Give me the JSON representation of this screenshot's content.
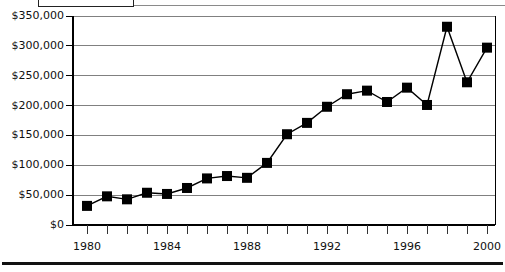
{
  "chart_data": {
    "type": "line",
    "title": "",
    "subtitle": "",
    "xlabel": "",
    "ylabel": "",
    "x": [
      1980,
      1981,
      1982,
      1983,
      1984,
      1985,
      1986,
      1987,
      1988,
      1989,
      1990,
      1991,
      1992,
      1993,
      1994,
      1995,
      1996,
      1997,
      1998,
      1999,
      2000
    ],
    "values": [
      32000,
      48000,
      43000,
      54000,
      52000,
      62000,
      78000,
      82000,
      79000,
      104000,
      152000,
      171000,
      198000,
      219000,
      225000,
      206000,
      230000,
      201000,
      332000,
      239000,
      297000
    ],
    "series": [
      {
        "name": "",
        "marker": "filled-square",
        "color": "#000000",
        "values": [
          32000,
          48000,
          43000,
          54000,
          52000,
          62000,
          78000,
          82000,
          79000,
          104000,
          152000,
          171000,
          198000,
          219000,
          225000,
          206000,
          230000,
          201000,
          332000,
          239000,
          297000
        ]
      }
    ],
    "xlim": [
      1980,
      2000
    ],
    "ylim": [
      0,
      350000
    ],
    "ytick_values": [
      0,
      50000,
      100000,
      150000,
      200000,
      250000,
      300000,
      350000
    ],
    "ytick_labels": [
      "$0",
      "$50,000",
      "$100,000",
      "$150,000",
      "$200,000",
      "$250,000",
      "$300,000",
      "$350,000"
    ],
    "xtick_values": [
      1980,
      1981,
      1982,
      1983,
      1984,
      1985,
      1986,
      1987,
      1988,
      1989,
      1990,
      1991,
      1992,
      1993,
      1994,
      1995,
      1996,
      1997,
      1998,
      1999,
      2000
    ],
    "xtick_labels_shown": [
      "1980",
      "1984",
      "1988",
      "1992",
      "1996",
      "2000"
    ],
    "xtick_labels_shown_values": [
      1980,
      1984,
      1988,
      1992,
      1996,
      2000
    ],
    "grid": "horizontal",
    "gridline_color": "#808080",
    "axis_color": "#000000",
    "legend": {
      "position": "top-left",
      "visible_entries": [],
      "note": "legend box is cropped off the top edge of the screenshot"
    },
    "annotations": []
  },
  "geometry": {
    "plot_left": 73,
    "plot_right": 495,
    "plot_top": 16,
    "plot_bottom": 225,
    "first_point_x": 87,
    "point_spacing": 20,
    "marker_size": 10
  }
}
